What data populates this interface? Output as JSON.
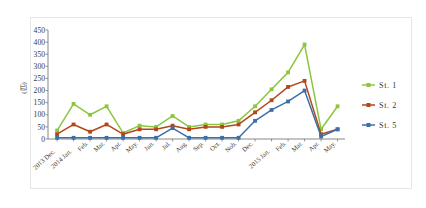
{
  "chart_data": {
    "type": "line",
    "title": "",
    "xlabel": "",
    "ylabel": "(匹)",
    "ylim": [
      0,
      450
    ],
    "ytick_step": 50,
    "yticks": [
      0,
      50,
      100,
      150,
      200,
      250,
      300,
      350,
      400,
      450
    ],
    "grid": false,
    "legend_position": "right",
    "categories": [
      "2013 Dec.",
      "2014 Jan.",
      "Feb.",
      "Mar.",
      "Apr.",
      "May.",
      "Jun.",
      "Jul.",
      "Aug.",
      "Sep.",
      "Oct.",
      "Nob.",
      "Dec.",
      "2015 Jan.",
      "Feb.",
      "Mar.",
      "Apr.",
      "May."
    ],
    "series": [
      {
        "name": "St. 1",
        "color": "#8CC63E",
        "values": [
          35,
          145,
          100,
          135,
          25,
          55,
          50,
          95,
          50,
          60,
          60,
          75,
          135,
          205,
          275,
          390,
          40,
          135
        ]
      },
      {
        "name": "St. 2",
        "color": "#B3471B",
        "values": [
          20,
          60,
          30,
          60,
          20,
          40,
          40,
          55,
          40,
          50,
          50,
          60,
          110,
          160,
          215,
          240,
          20,
          40
        ]
      },
      {
        "name": "St. 5",
        "color": "#3B6FA8",
        "values": [
          5,
          5,
          5,
          5,
          5,
          5,
          5,
          45,
          5,
          5,
          5,
          5,
          75,
          120,
          155,
          200,
          10,
          40
        ]
      }
    ]
  },
  "legend": {
    "items": [
      {
        "label": "St. 1",
        "color": "#8CC63E"
      },
      {
        "label": "St. 2",
        "color": "#B3471B"
      },
      {
        "label": "St. 5",
        "color": "#3B6FA8"
      }
    ]
  },
  "colors": {
    "background": "#ffffff",
    "frame_border": "#e8e6e0",
    "axis": "#6b6b63",
    "text": "#3a3a36"
  }
}
